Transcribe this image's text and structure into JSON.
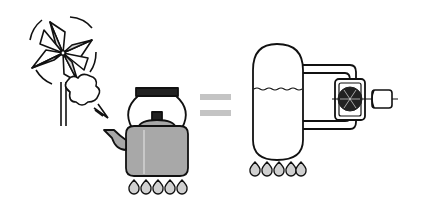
{
  "diagram": {
    "type": "illustration",
    "left_panel": {
      "elements": [
        "pinwheel",
        "steam-cloud",
        "kettle",
        "gas-flames"
      ],
      "flame_count": 5
    },
    "operator": "equals-sign",
    "right_panel": {
      "elements": [
        "boiler-tank",
        "water-level",
        "steam-pipe",
        "turbine",
        "generator",
        "gas-flames"
      ],
      "flame_count": 5
    },
    "colors": {
      "stroke": "#111111",
      "fill_gray": "#a8a8a8",
      "fill_light": "#d8d8d8",
      "equals": "#c4c4c4",
      "background": "#ffffff"
    }
  }
}
